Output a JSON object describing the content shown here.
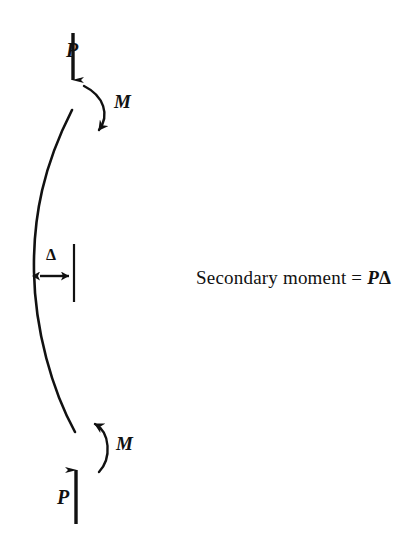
{
  "figure": {
    "background_color": "#ffffff",
    "ink_color": "#111111"
  },
  "labels": {
    "load_top": "P",
    "load_bottom": "P",
    "moment_top": "M",
    "moment_bottom": "M",
    "deflection": "Δ"
  },
  "caption": {
    "prefix": "Secondary moment = ",
    "force_symbol": "P",
    "deflection_symbol": "Δ",
    "full_text": "Secondary moment = PΔ"
  },
  "geometry": {
    "column_curve": {
      "top_point": [
        72,
        110
      ],
      "max_deflection_point": [
        34,
        270
      ],
      "bottom_point": [
        75,
        432
      ],
      "description": "Column bowed to the left between pinned ends"
    },
    "reference_line": {
      "x": 74,
      "y_start": 244,
      "y_end": 302
    },
    "deflection_arrow": {
      "y": 276,
      "x_start": 35,
      "x_end": 74,
      "double_headed": true
    },
    "load_arrow_top": {
      "x": 73,
      "y_start": 33,
      "y_end": 92,
      "direction": "down"
    },
    "load_arrow_bottom": {
      "x": 76,
      "y_start": 524,
      "y_end": 458,
      "direction": "up"
    },
    "moment_arc_top": {
      "start": [
        84,
        86
      ],
      "end": [
        96,
        137
      ],
      "rotation": "clockwise"
    },
    "moment_arc_bottom": {
      "start": [
        99,
        472
      ],
      "end": [
        91,
        418
      ],
      "rotation": "counterclockwise"
    }
  }
}
